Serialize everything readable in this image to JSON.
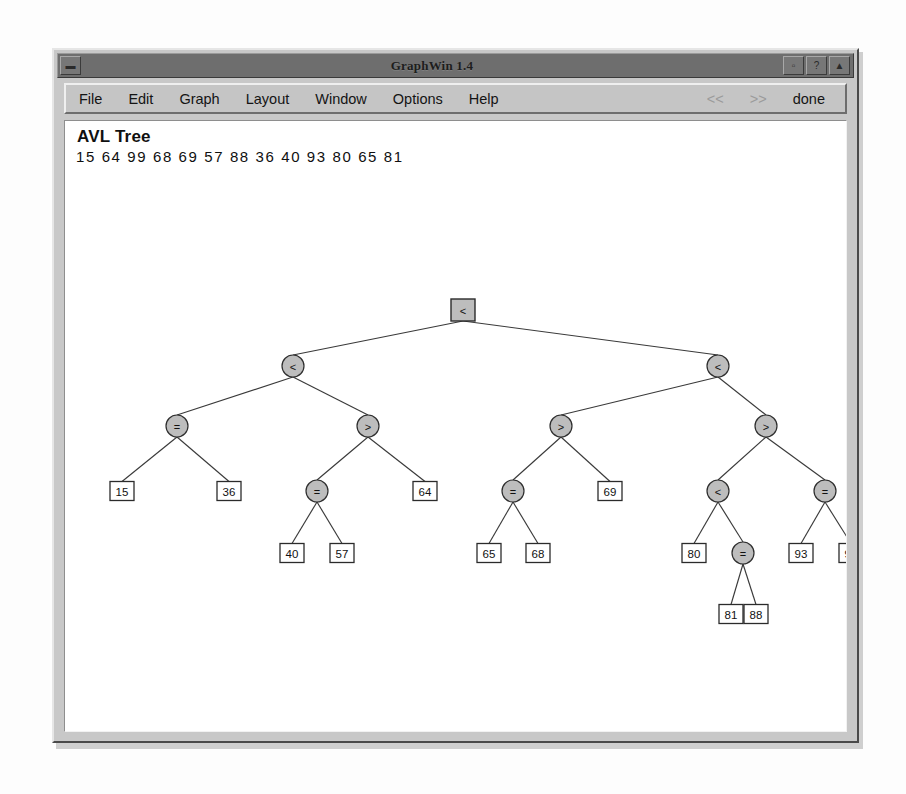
{
  "window": {
    "title": "GraphWin 1.4",
    "controls": {
      "left_button": "window-menu",
      "right_buttons": [
        "minimize",
        "maximize",
        "close"
      ]
    }
  },
  "menubar": {
    "items": [
      {
        "label": "File",
        "enabled": true
      },
      {
        "label": "Edit",
        "enabled": true
      },
      {
        "label": "Graph",
        "enabled": true
      },
      {
        "label": "Layout",
        "enabled": true
      },
      {
        "label": "Window",
        "enabled": true
      },
      {
        "label": "Options",
        "enabled": true
      },
      {
        "label": "Help",
        "enabled": true
      }
    ],
    "nav": [
      {
        "label": "<<",
        "enabled": false
      },
      {
        "label": ">>",
        "enabled": false
      }
    ],
    "done_label": "done"
  },
  "canvas": {
    "title": "AVL Tree",
    "sequence": "15 64 99 68 69 57 88 36 40 93 80 65 81",
    "sequence_values": [
      15,
      64,
      99,
      68,
      69,
      57,
      88,
      36,
      40,
      93,
      80,
      65,
      81
    ]
  },
  "tree": {
    "colors": {
      "node_fill": "#bdbdbd",
      "leaf_fill": "#ffffff",
      "stroke": "#2e2e2e",
      "edge": "#3a3a3a"
    },
    "nodes": [
      {
        "id": "n0",
        "label": "<",
        "shape": "square",
        "x": 398,
        "y": 189
      },
      {
        "id": "n1",
        "label": "<",
        "shape": "circle",
        "x": 228,
        "y": 245
      },
      {
        "id": "n2",
        "label": "<",
        "shape": "circle",
        "x": 653,
        "y": 245
      },
      {
        "id": "n3",
        "label": "=",
        "shape": "circle",
        "x": 112,
        "y": 305
      },
      {
        "id": "n4",
        "label": ">",
        "shape": "circle",
        "x": 303,
        "y": 305
      },
      {
        "id": "n5",
        "label": ">",
        "shape": "circle",
        "x": 496,
        "y": 305
      },
      {
        "id": "n6",
        "label": ">",
        "shape": "circle",
        "x": 701,
        "y": 305
      },
      {
        "id": "n7",
        "label": "15",
        "shape": "leaf",
        "x": 57,
        "y": 370
      },
      {
        "id": "n8",
        "label": "36",
        "shape": "leaf",
        "x": 164,
        "y": 370
      },
      {
        "id": "n9",
        "label": "=",
        "shape": "circle",
        "x": 252,
        "y": 370
      },
      {
        "id": "n10",
        "label": "64",
        "shape": "leaf",
        "x": 360,
        "y": 370
      },
      {
        "id": "n11",
        "label": "=",
        "shape": "circle",
        "x": 448,
        "y": 370
      },
      {
        "id": "n12",
        "label": "69",
        "shape": "leaf",
        "x": 545,
        "y": 370
      },
      {
        "id": "n13",
        "label": "<",
        "shape": "circle",
        "x": 653,
        "y": 370
      },
      {
        "id": "n14",
        "label": "=",
        "shape": "circle",
        "x": 760,
        "y": 370
      },
      {
        "id": "n15",
        "label": "40",
        "shape": "leaf",
        "x": 227,
        "y": 432
      },
      {
        "id": "n16",
        "label": "57",
        "shape": "leaf",
        "x": 277,
        "y": 432
      },
      {
        "id": "n17",
        "label": "65",
        "shape": "leaf",
        "x": 424,
        "y": 432
      },
      {
        "id": "n18",
        "label": "68",
        "shape": "leaf",
        "x": 473,
        "y": 432
      },
      {
        "id": "n19",
        "label": "80",
        "shape": "leaf",
        "x": 629,
        "y": 432
      },
      {
        "id": "n20",
        "label": "=",
        "shape": "circle",
        "x": 678,
        "y": 432
      },
      {
        "id": "n21",
        "label": "93",
        "shape": "leaf",
        "x": 736,
        "y": 432
      },
      {
        "id": "n22",
        "label": "99",
        "shape": "leaf",
        "x": 786,
        "y": 432
      },
      {
        "id": "n23",
        "label": "81",
        "shape": "leaf",
        "x": 666,
        "y": 493
      },
      {
        "id": "n24",
        "label": "88",
        "shape": "leaf",
        "x": 691,
        "y": 493
      }
    ],
    "edges": [
      [
        "n0",
        "n1"
      ],
      [
        "n0",
        "n2"
      ],
      [
        "n1",
        "n3"
      ],
      [
        "n1",
        "n4"
      ],
      [
        "n2",
        "n5"
      ],
      [
        "n2",
        "n6"
      ],
      [
        "n3",
        "n7"
      ],
      [
        "n3",
        "n8"
      ],
      [
        "n4",
        "n9"
      ],
      [
        "n4",
        "n10"
      ],
      [
        "n5",
        "n11"
      ],
      [
        "n5",
        "n12"
      ],
      [
        "n6",
        "n13"
      ],
      [
        "n6",
        "n14"
      ],
      [
        "n9",
        "n15"
      ],
      [
        "n9",
        "n16"
      ],
      [
        "n11",
        "n17"
      ],
      [
        "n11",
        "n18"
      ],
      [
        "n13",
        "n19"
      ],
      [
        "n13",
        "n20"
      ],
      [
        "n14",
        "n21"
      ],
      [
        "n14",
        "n22"
      ],
      [
        "n20",
        "n23"
      ],
      [
        "n20",
        "n24"
      ]
    ]
  }
}
